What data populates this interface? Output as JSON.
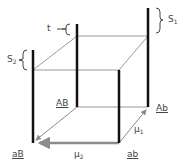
{
  "diagram": {
    "colors": {
      "thick_line": "#111111",
      "thin_line": "#9a9a9a",
      "arrow_mu2": "#8c8c8c",
      "text": "#444444"
    },
    "vertices": {
      "AB": {
        "label": "AB",
        "underlined": true
      },
      "Ab": {
        "label": "Ab",
        "underlined": true
      },
      "aB": {
        "label": "aB",
        "underlined": true
      },
      "ab": {
        "label": "ab",
        "underlined": true
      }
    },
    "brackets": {
      "S1": {
        "label": "S",
        "subscript": "1"
      },
      "S2": {
        "label": "S",
        "subscript": "2"
      },
      "t": {
        "label": "t"
      }
    },
    "arrows": {
      "mu1": {
        "label": "μ",
        "subscript": "1"
      },
      "mu2": {
        "label": "μ",
        "subscript": "2"
      }
    }
  }
}
